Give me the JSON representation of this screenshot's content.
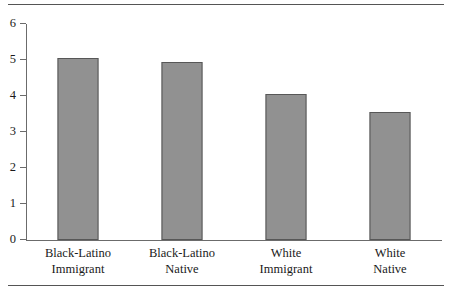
{
  "chart_data": {
    "type": "bar",
    "title": "",
    "subtitle": "",
    "xlabel": "",
    "ylabel": "",
    "categories": [
      "Black-Latino Immigrant",
      "Black-Latino Native",
      "White Immigrant",
      "White Native"
    ],
    "category_lines": [
      [
        "Black-Latino",
        "Immigrant"
      ],
      [
        "Black-Latino",
        "Native"
      ],
      [
        "White",
        "Immigrant"
      ],
      [
        "White",
        "Native"
      ]
    ],
    "values": [
      5.05,
      4.95,
      4.05,
      3.55
    ],
    "ylim": [
      0,
      6
    ],
    "ytick_labels": [
      "0",
      "1",
      "2",
      "3",
      "4",
      "5",
      "6"
    ],
    "ytick_values": [
      0,
      1,
      2,
      3,
      4,
      5,
      6
    ],
    "grid": false,
    "legend": null,
    "annotations": [],
    "colors": {
      "bar_fill": "#919191",
      "bar_border": "#575757",
      "axis": "#6b6b6b",
      "rule": "#555555",
      "text": "#1a1a1a",
      "background": "#ffffff"
    }
  }
}
